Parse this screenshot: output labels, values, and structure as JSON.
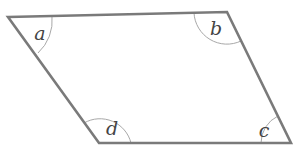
{
  "diagram": {
    "type": "parallelogram",
    "colors": {
      "edge": "#7a7a7a",
      "arc": "#a8a8a8",
      "label": "#444444",
      "background": "#ffffff"
    },
    "vertices": {
      "a": {
        "x": 8,
        "y": 17
      },
      "b": {
        "x": 227,
        "y": 12
      },
      "c": {
        "x": 291,
        "y": 143
      },
      "d": {
        "x": 99,
        "y": 143
      }
    },
    "angles": [
      {
        "label": "a",
        "x": 40,
        "y": 33
      },
      {
        "label": "b",
        "x": 216,
        "y": 28
      },
      {
        "label": "c",
        "x": 264,
        "y": 130
      },
      {
        "label": "d",
        "x": 112,
        "y": 128
      }
    ]
  }
}
